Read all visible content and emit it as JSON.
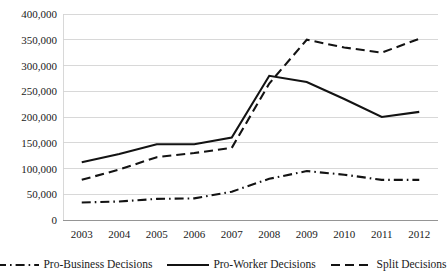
{
  "chart_data": {
    "type": "line",
    "title": "",
    "xlabel": "",
    "ylabel": "",
    "categories": [
      "2003",
      "2004",
      "2005",
      "2006",
      "2007",
      "2008",
      "2009",
      "2010",
      "2011",
      "2012"
    ],
    "x": [
      2003,
      2004,
      2005,
      2006,
      2007,
      2008,
      2009,
      2010,
      2011,
      2012
    ],
    "ylim": [
      0,
      400000
    ],
    "ytick_values": [
      0,
      50000,
      100000,
      150000,
      200000,
      250000,
      300000,
      350000,
      400000
    ],
    "ytick_labels": [
      "0",
      "50,000",
      "100,000",
      "150,000",
      "200,000",
      "250,000",
      "300,000",
      "350,000",
      "400,000"
    ],
    "grid": true,
    "legend_position": "bottom",
    "series": [
      {
        "name": "Pro-Business Decisions",
        "style": "dashdot",
        "color": "#131313",
        "values": [
          34000,
          36000,
          41000,
          42000,
          55000,
          80000,
          95000,
          88000,
          78000,
          78000
        ]
      },
      {
        "name": "Pro-Worker Decisions",
        "style": "solid",
        "color": "#131313",
        "values": [
          112000,
          128000,
          147000,
          147000,
          160000,
          280000,
          268000,
          235000,
          200000,
          210000
        ]
      },
      {
        "name": "Split Decisions",
        "style": "dashed",
        "color": "#131313",
        "values": [
          78000,
          98000,
          122000,
          130000,
          140000,
          265000,
          350000,
          335000,
          325000,
          352000
        ]
      }
    ]
  },
  "legend": {
    "entries": [
      {
        "label": "Pro-Business Decisions",
        "swatch": "dashdot-line-icon"
      },
      {
        "label": "Pro-Worker Decisions",
        "swatch": "solid-line-icon"
      },
      {
        "label": "Split Decisions",
        "swatch": "dashed-line-icon"
      }
    ]
  }
}
